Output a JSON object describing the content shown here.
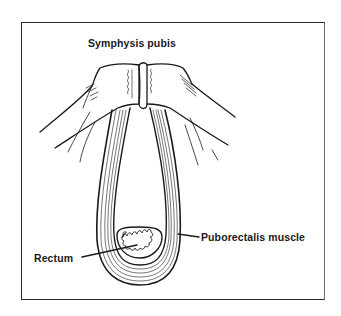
{
  "figure": {
    "labels": {
      "symphysis": "Symphysis pubis",
      "puborectalis": "Puborectalis muscle",
      "rectum": "Rectum"
    },
    "colors": {
      "line": "#1a1a1a",
      "background": "#ffffff",
      "frame": "#2a2a2a"
    }
  }
}
